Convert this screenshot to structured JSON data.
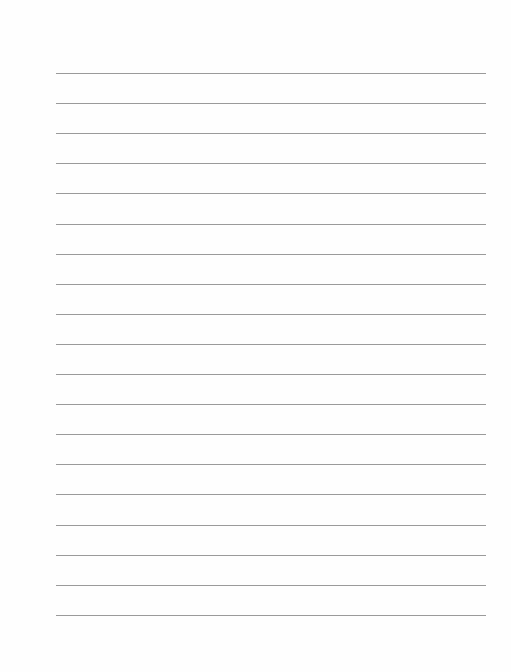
{
  "page": {
    "type": "blank lined paper",
    "background_color": "#fefefe",
    "rule_color": "#9a9a9a",
    "rules": {
      "count": 19,
      "first_y": 73,
      "spacing": 30.1,
      "left_x": 56,
      "right_x": 486
    }
  }
}
